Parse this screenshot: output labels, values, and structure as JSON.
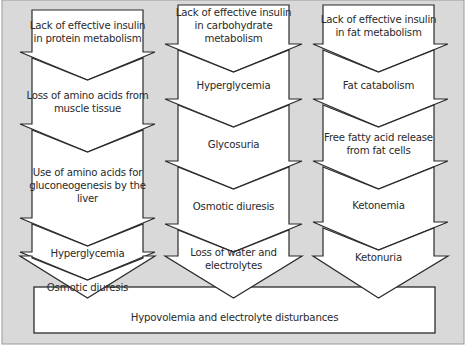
{
  "diagram": {
    "columns": [
      {
        "id": "protein",
        "steps": [
          "Lack of effective insulin in protein metabolism",
          "Loss of amino acids from muscle tissue",
          "Use of amino acids for gluconeogenesis by the liver",
          "Hyperglycemia",
          "Osmotic diuresis"
        ]
      },
      {
        "id": "carbohydrate",
        "steps": [
          "Lack of effective insulin in carbohydrate metabolism",
          "Hyperglycemia",
          "Glycosuria",
          "Osmotic diuresis",
          "Loss of water and electrolytes"
        ]
      },
      {
        "id": "fat",
        "steps": [
          "Lack of effective insulin in fat metabolism",
          "Fat catabolism",
          "Free fatty acid release from fat cells",
          "Ketonemia",
          "Ketonuria"
        ]
      }
    ],
    "outcome": "Hypovolemia and electrolyte disturbances",
    "colors": {
      "background": "#d9d9d9",
      "box_fill": "#ffffff",
      "stroke": "#2b2b2b",
      "text": "#2a2a2a"
    }
  }
}
